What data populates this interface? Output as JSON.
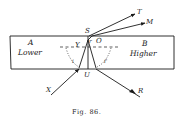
{
  "figure": {
    "caption": "Fig. 86.",
    "regions": {
      "left": {
        "letter": "A",
        "label": "Lower"
      },
      "right": {
        "letter": "B",
        "label": "Higher"
      }
    },
    "points": {
      "S": "S",
      "O": "O",
      "U": "U",
      "Y": "Y",
      "T": "T",
      "M": "M",
      "X": "X",
      "R": "R"
    },
    "angle_labels": {
      "left": "i",
      "right": "i'",
      "top": "r"
    }
  }
}
